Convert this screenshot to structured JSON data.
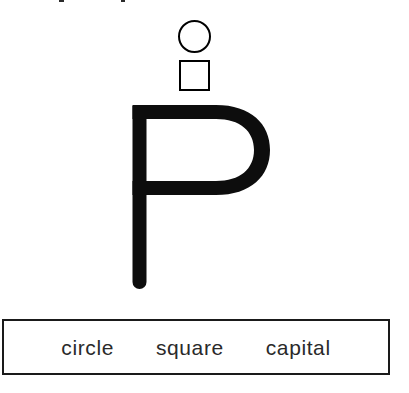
{
  "page": {
    "kind": "handwriting-worksheet",
    "background_color": "#ffffff",
    "ink_color": "#000000",
    "width": 409,
    "height": 393
  },
  "prompt_shapes": {
    "items": [
      {
        "name": "circle",
        "shape": "circle",
        "fill": "none",
        "stroke_color": "#000000"
      },
      {
        "name": "square",
        "shape": "square",
        "fill": "none",
        "stroke_color": "#000000"
      }
    ]
  },
  "letter": {
    "character": "P",
    "case": "capital",
    "color": "#000000",
    "style": "rounded-geometric-sans"
  },
  "word_bank": {
    "border_color": "#1a1a1a",
    "text_color": "#2a2a2a",
    "words": [
      {
        "label": "circle"
      },
      {
        "label": "square"
      },
      {
        "label": "capital"
      }
    ]
  }
}
